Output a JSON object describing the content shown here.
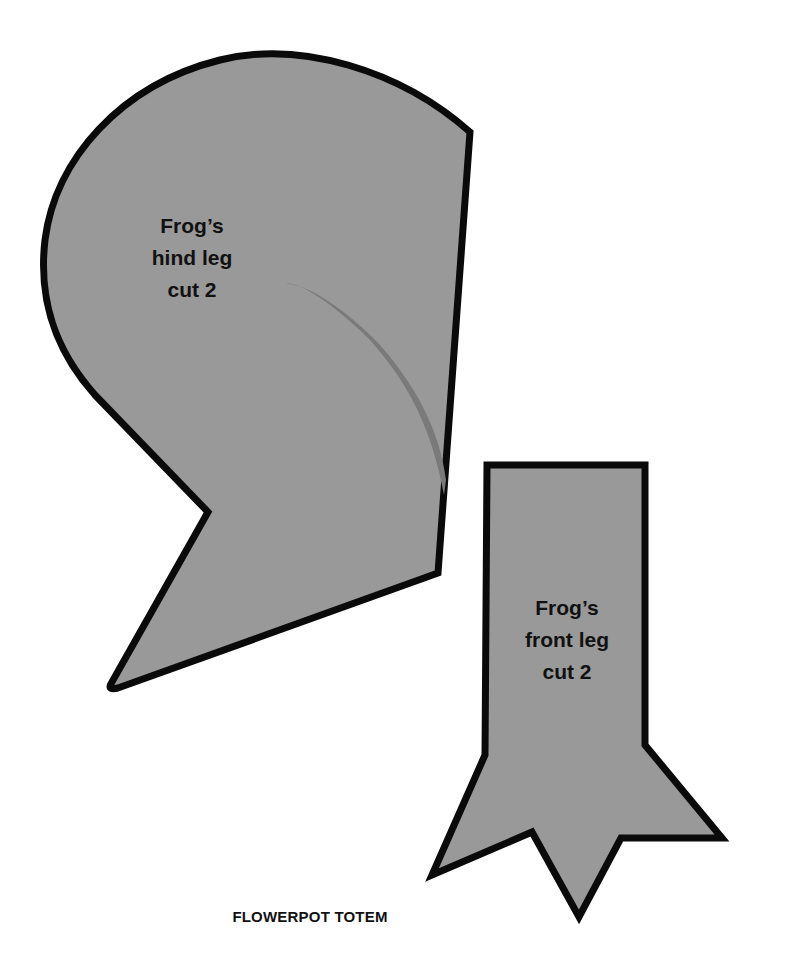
{
  "sheet": {
    "title": "FLOWERPOT TOTEM",
    "colors": {
      "background": "#ffffff",
      "piece_fill": "#999999",
      "outline": "#0a0a0a",
      "fold_stripe": "#7a7a7a",
      "text": "#111111"
    }
  },
  "pieces": [
    {
      "id": "hind-leg",
      "label_lines": [
        "Frog’s",
        "hind leg",
        "cut 2"
      ]
    },
    {
      "id": "front-leg",
      "label_lines": [
        "Frog’s",
        "front leg",
        "cut 2"
      ]
    }
  ]
}
